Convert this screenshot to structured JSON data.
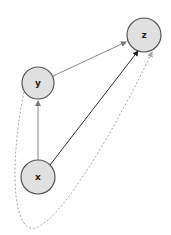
{
  "caption": "",
  "nodes": [
    {
      "id": "z",
      "label": "z",
      "cx": 144,
      "cy": 35,
      "r": 17
    },
    {
      "id": "y",
      "label": "y",
      "cx": 38,
      "cy": 83,
      "r": 16
    },
    {
      "id": "x",
      "label": "x",
      "cx": 38,
      "cy": 177,
      "r": 17
    }
  ],
  "edges": [
    {
      "from": "y",
      "to": "z",
      "style": "solid",
      "color": "#888888"
    },
    {
      "from": "x",
      "to": "y",
      "style": "solid",
      "color": "#888888"
    },
    {
      "from": "x",
      "to": "z",
      "style": "solid",
      "color": "#333333"
    },
    {
      "from": "y",
      "to": "z",
      "style": "dashed-curve",
      "color": "#aaaaaa"
    }
  ],
  "colors": {
    "node_fill": "#e0e0e0",
    "node_stroke": "#555555"
  }
}
